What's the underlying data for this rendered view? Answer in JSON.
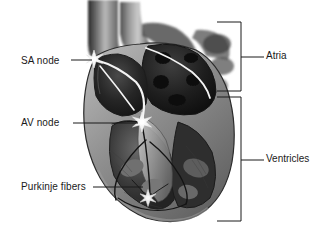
{
  "figure": {
    "style": "grayscale-halftone-illustration",
    "background_color": "#ffffff",
    "line_color": "#1a1a1a",
    "label_font_size_px": 10
  },
  "callouts": [
    {
      "id": "sa-node",
      "label": "SA node",
      "text_x": 21,
      "text_y": 56,
      "leader_from_x": 71,
      "leader_from_y": 60,
      "leader_to_x": 92,
      "leader_to_y": 60,
      "marker_x": 94,
      "marker_y": 59,
      "marker": "star-burst"
    },
    {
      "id": "av-node",
      "label": "AV node",
      "text_x": 21,
      "text_y": 118,
      "leader_from_x": 73,
      "leader_from_y": 123,
      "leader_to_x": 138,
      "leader_to_y": 123,
      "marker_x": 142,
      "marker_y": 122,
      "marker": "star-burst"
    },
    {
      "id": "purkinje-fibers",
      "label": "Purkinje fibers",
      "text_x": 21,
      "text_y": 182,
      "leader_from_x": 93,
      "leader_from_y": 187,
      "leader_to_x": 143,
      "leader_to_y": 187,
      "marker_x": 148,
      "marker_y": 198,
      "marker": "star-burst"
    }
  ],
  "brackets": [
    {
      "id": "atria",
      "label": "Atria",
      "x": 241,
      "top_y": 22,
      "bottom_y": 91,
      "tick_y": 57,
      "tick_end_x": 264,
      "arm_length": 24
    },
    {
      "id": "ventricles",
      "label": "Ventricles",
      "x": 241,
      "top_y": 97,
      "bottom_y": 221,
      "tick_y": 160,
      "tick_end_x": 264,
      "arm_length": 24
    }
  ],
  "anatomy_regions": [
    {
      "id": "superior-vena-cava",
      "label": "superior vena cava"
    },
    {
      "id": "aorta",
      "label": "aorta"
    },
    {
      "id": "pulmonary-artery",
      "label": "pulmonary artery"
    },
    {
      "id": "right-atrium",
      "label": "right atrium"
    },
    {
      "id": "left-atrium",
      "label": "left atrium"
    },
    {
      "id": "right-ventricle",
      "label": "right ventricle"
    },
    {
      "id": "left-ventricle",
      "label": "left ventricle"
    },
    {
      "id": "interventricular-septum",
      "label": "interventricular septum"
    },
    {
      "id": "bundle-of-his",
      "label": "bundle of His"
    },
    {
      "id": "bundle-branches",
      "label": "bundle branches"
    },
    {
      "id": "papillary-muscles",
      "label": "papillary muscles"
    },
    {
      "id": "apex",
      "label": "apex"
    }
  ]
}
